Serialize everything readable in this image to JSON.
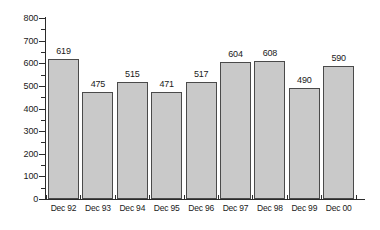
{
  "chart_data": {
    "type": "bar",
    "title": "",
    "subtitle": "",
    "xlabel": "",
    "ylabel": "",
    "categories": [
      "Dec 92",
      "Dec 93",
      "Dec 94",
      "Dec 95",
      "Dec 96",
      "Dec 97",
      "Dec 98",
      "Dec 99",
      "Dec 00"
    ],
    "values": [
      619,
      475,
      515,
      471,
      517,
      604,
      608,
      490,
      590
    ],
    "data_labels": [
      "619",
      "475",
      "515",
      "471",
      "517",
      "604",
      "608",
      "490",
      "590"
    ],
    "ylim": [
      0,
      800
    ],
    "y_ticks": [
      0,
      100,
      200,
      300,
      400,
      500,
      600,
      700,
      800
    ],
    "y_tick_labels": [
      "0",
      "100",
      "200",
      "300",
      "400",
      "500",
      "600",
      "700",
      "800"
    ],
    "y_minor_tick_interval": 50,
    "grid": false,
    "legend": false,
    "legend_position": "none",
    "series": [
      {
        "name": "",
        "values": [
          619,
          475,
          515,
          471,
          517,
          604,
          608,
          490,
          590
        ]
      }
    ]
  },
  "style": {
    "bar_fill": "#c9c9c9",
    "bar_stroke": "#4a4a4a",
    "axis_color": "#2b2b2b",
    "text_color": "#1a1a1a",
    "background": "#ffffff"
  }
}
